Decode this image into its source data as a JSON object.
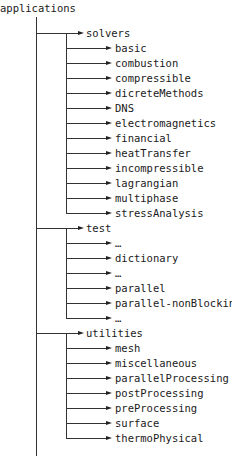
{
  "root": {
    "label": "applications"
  },
  "groups": [
    {
      "label": "solvers",
      "children": [
        "basic",
        "combustion",
        "compressible",
        "dicreteMethods",
        "DNS",
        "electromagnetics",
        "financial",
        "heatTransfer",
        "incompressible",
        "lagrangian",
        "multiphase",
        "stressAnalysis"
      ]
    },
    {
      "label": "test",
      "children": [
        "…",
        "dictionary",
        "…",
        "parallel",
        "parallel-nonBlocking",
        "…"
      ]
    },
    {
      "label": "utilities",
      "children": [
        "mesh",
        "miscellaneous",
        "parallelProcessing",
        "postProcessing",
        "preProcessing",
        "surface",
        "thermoPhysical"
      ]
    }
  ],
  "colors": {
    "line": "#333333",
    "text": "#1a1a1a"
  }
}
